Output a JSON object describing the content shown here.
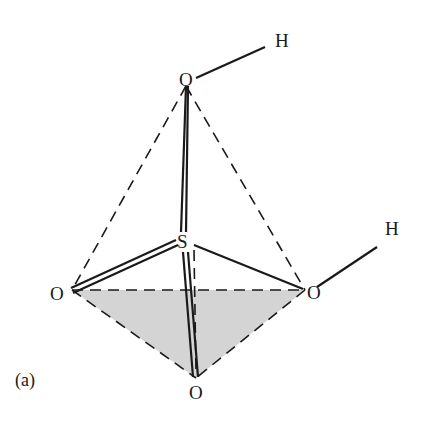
{
  "diagram": {
    "caption": "(a)",
    "atoms": {
      "o_top": "O",
      "h_top": "H",
      "s_center": "S",
      "o_left": "O",
      "o_right": "O",
      "h_right": "H",
      "o_bottom": "O"
    },
    "colors": {
      "line": "#1a1a1a",
      "shaded_face": "#d4d4d4"
    }
  }
}
